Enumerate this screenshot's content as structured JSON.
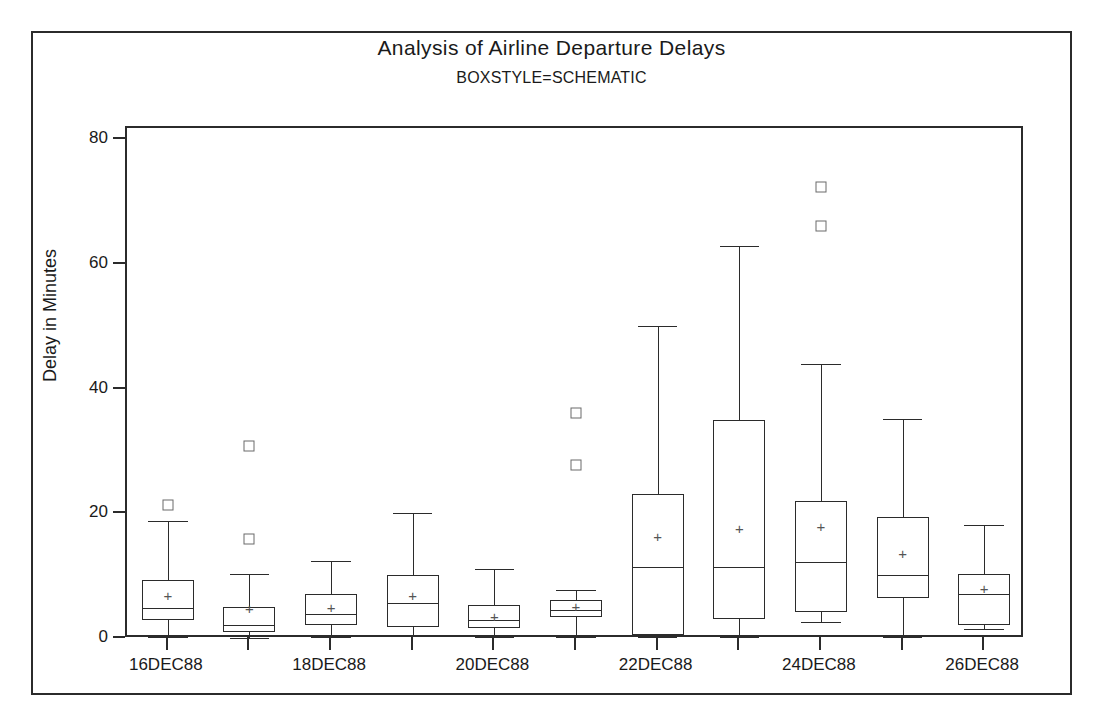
{
  "chart_data": {
    "type": "box",
    "title": "Analysis of Airline Departure Delays",
    "subtitle": "BOXSTYLE=SCHEMATIC",
    "xlabel": "",
    "ylabel": "Delay in Minutes",
    "ylim": [
      0,
      82
    ],
    "yticks": [
      0,
      20,
      40,
      60,
      80
    ],
    "ytick_labels": [
      "0",
      "20",
      "40",
      "60",
      "80"
    ],
    "grid": false,
    "legend": null,
    "xtick_labels": [
      "16DEC88",
      "",
      "18DEC88",
      "",
      "20DEC88",
      "",
      "22DEC88",
      "",
      "24DEC88",
      "",
      "26DEC88"
    ],
    "categories": [
      "16DEC88",
      "17DEC88",
      "18DEC88",
      "19DEC88",
      "20DEC88",
      "21DEC88",
      "22DEC88",
      "23DEC88",
      "24DEC88",
      "25DEC88",
      "26DEC88"
    ],
    "boxes": [
      {
        "category": "16DEC88",
        "whisker_low": 0.3,
        "q1": 3.0,
        "median": 5.0,
        "q3": 9.5,
        "whisker_high": 19.0,
        "mean": 7.0,
        "outliers": [
          21.5
        ]
      },
      {
        "category": "17DEC88",
        "whisker_low": 0.2,
        "q1": 1.2,
        "median": 2.2,
        "q3": 5.2,
        "whisker_high": 10.5,
        "mean": 5.0,
        "outliers": [
          31.0,
          16.0
        ]
      },
      {
        "category": "18DEC88",
        "whisker_low": 0.3,
        "q1": 2.2,
        "median": 4.0,
        "q3": 7.2,
        "whisker_high": 12.5,
        "mean": 5.1,
        "outliers": []
      },
      {
        "category": "19DEC88",
        "whisker_low": 0.5,
        "q1": 2.0,
        "median": 5.8,
        "q3": 10.2,
        "whisker_high": 20.2,
        "mean": 7.0,
        "outliers": []
      },
      {
        "category": "20DEC88",
        "whisker_low": 0.3,
        "q1": 1.8,
        "median": 3.0,
        "q3": 5.5,
        "whisker_high": 11.3,
        "mean": 3.7,
        "outliers": []
      },
      {
        "category": "21DEC88",
        "whisker_low": 0.4,
        "q1": 3.6,
        "median": 4.6,
        "q3": 6.3,
        "whisker_high": 7.8,
        "mean": 5.3,
        "outliers": [
          36.2,
          28.0
        ]
      },
      {
        "category": "22DEC88",
        "whisker_low": 0.3,
        "q1": 0.7,
        "median": 11.5,
        "q3": 23.2,
        "whisker_high": 50.3,
        "mean": 16.5,
        "outliers": []
      },
      {
        "category": "23DEC88",
        "whisker_low": 0.3,
        "q1": 3.2,
        "median": 11.5,
        "q3": 35.2,
        "whisker_high": 63.0,
        "mean": 17.8,
        "outliers": []
      },
      {
        "category": "24DEC88",
        "whisker_low": 2.7,
        "q1": 4.3,
        "median": 12.4,
        "q3": 22.1,
        "whisker_high": 44.2,
        "mean": 18.2,
        "outliers": [
          72.5,
          66.2
        ]
      },
      {
        "category": "25DEC88",
        "whisker_low": 0.4,
        "q1": 6.5,
        "median": 10.3,
        "q3": 19.5,
        "whisker_high": 35.3,
        "mean": 13.8,
        "outliers": []
      },
      {
        "category": "26DEC88",
        "whisker_low": 1.6,
        "q1": 2.2,
        "median": 7.3,
        "q3": 10.5,
        "whisker_high": 18.3,
        "mean": 8.2,
        "outliers": []
      }
    ],
    "colors": {
      "line": "#2b2b2b",
      "outlier": "#6a6a6a",
      "mean": "#555555",
      "background": "#ffffff"
    },
    "mean_marker": "+"
  }
}
